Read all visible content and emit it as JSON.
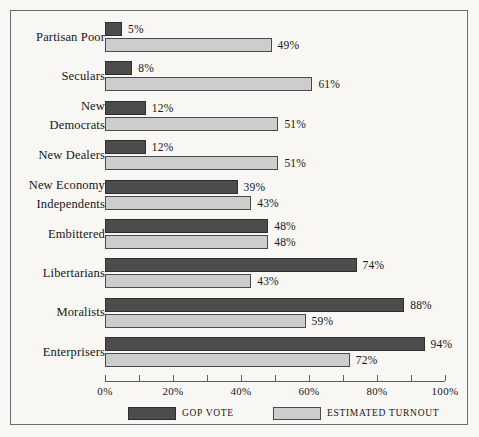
{
  "chart_data": {
    "type": "bar",
    "orientation": "horizontal",
    "title": "",
    "xlabel": "",
    "ylabel": "",
    "xlim": [
      0,
      100
    ],
    "xtick_step": 10,
    "xtick_label_step": 20,
    "xticks": [
      0,
      10,
      20,
      30,
      40,
      50,
      60,
      70,
      80,
      90,
      100
    ],
    "xtick_labels": [
      "0%",
      "",
      "20%",
      "",
      "40%",
      "",
      "60%",
      "",
      "80%",
      "",
      "100%"
    ],
    "grid": false,
    "legend_position": "bottom",
    "value_label_suffix": "%",
    "categories": [
      "Partisan Poor",
      "Seculars",
      "New Democrats",
      "New Dealers",
      "New Economy Independents",
      "Embittered",
      "Libertarians",
      "Moralists",
      "Enterprisers"
    ],
    "series": [
      {
        "name": "GOP VOTE",
        "color": "#4c4c4c",
        "values": [
          5,
          8,
          12,
          12,
          39,
          48,
          74,
          88,
          94
        ],
        "value_labels": [
          "5%",
          "8%",
          "12%",
          "12%",
          "39%",
          "48%",
          "74%",
          "88%",
          "94%"
        ]
      },
      {
        "name": "ESTIMATED TURNOUT",
        "color": "#cdcdcd",
        "values": [
          49,
          61,
          51,
          51,
          43,
          48,
          43,
          59,
          72
        ],
        "value_labels": [
          "49%",
          "61%",
          "51%",
          "51%",
          "43%",
          "48%",
          "43%",
          "59%",
          "72%"
        ]
      }
    ]
  },
  "rows": [
    {
      "label_line1": "Partisan Poor",
      "label_line2": "",
      "gop": "5%",
      "turnout": "49%"
    },
    {
      "label_line1": "Seculars",
      "label_line2": "",
      "gop": "8%",
      "turnout": "61%"
    },
    {
      "label_line1": "New",
      "label_line2": "Democrats",
      "gop": "12%",
      "turnout": "51%"
    },
    {
      "label_line1": "New Dealers",
      "label_line2": "",
      "gop": "12%",
      "turnout": "51%"
    },
    {
      "label_line1": "New Economy",
      "label_line2": "Independents",
      "gop": "39%",
      "turnout": "43%"
    },
    {
      "label_line1": "Embittered",
      "label_line2": "",
      "gop": "48%",
      "turnout": "48%"
    },
    {
      "label_line1": "Libertarians",
      "label_line2": "",
      "gop": "74%",
      "turnout": "43%"
    },
    {
      "label_line1": "Moralists",
      "label_line2": "",
      "gop": "88%",
      "turnout": "59%"
    },
    {
      "label_line1": "Enterprisers",
      "label_line2": "",
      "gop": "94%",
      "turnout": "72%"
    }
  ],
  "axis": {
    "labels": [
      "0%",
      "20%",
      "40%",
      "60%",
      "80%",
      "100%"
    ]
  },
  "legend": {
    "gop_label": "GOP VOTE",
    "turnout_label": "ESTIMATED TURNOUT"
  }
}
